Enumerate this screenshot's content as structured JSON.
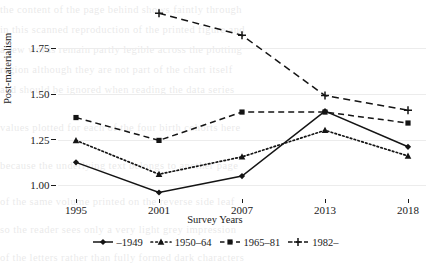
{
  "chart_data": {
    "type": "line",
    "title": "",
    "xlabel": "Survey Years",
    "ylabel": "Post-materialism",
    "x": [
      "1995",
      "2001",
      "2007",
      "2013",
      "2018"
    ],
    "categories": [
      "1995",
      "2001",
      "2007",
      "2013",
      "2018"
    ],
    "xtick_labels": [
      "1995",
      "2001",
      "2007",
      "2013",
      "2018"
    ],
    "ytick_labels": [
      "1.00",
      "1.25",
      "1.50",
      "1.75"
    ],
    "ytick_values": [
      1.0,
      1.25,
      1.5,
      1.75
    ],
    "ylim": [
      0.93,
      1.98
    ],
    "xlim_categories": true,
    "grid": "horizontal-faint",
    "legend_position": "bottom-center",
    "series": [
      {
        "name": "–1949",
        "label": "–1949",
        "marker": "diamond",
        "linestyle": "solid",
        "color": "#141414",
        "x": [
          "1995",
          "2001",
          "2007",
          "2013",
          "2018"
        ],
        "values": [
          1.125,
          0.96,
          1.05,
          1.405,
          1.21
        ]
      },
      {
        "name": "1950–64",
        "label": "1950–64",
        "marker": "triangle",
        "linestyle": "dotted",
        "color": "#141414",
        "x": [
          "1995",
          "2001",
          "2007",
          "2013",
          "2018"
        ],
        "values": [
          1.245,
          1.06,
          1.155,
          1.3,
          1.16
        ]
      },
      {
        "name": "1965–81",
        "label": "1965–81",
        "marker": "square",
        "linestyle": "dashed",
        "color": "#141414",
        "x": [
          "1995",
          "2001",
          "2007",
          "2013",
          "2018"
        ],
        "values": [
          1.37,
          1.245,
          1.4,
          1.4,
          1.34
        ]
      },
      {
        "name": "1982–",
        "label": "1982–",
        "marker": "plus",
        "linestyle": "dashed-long",
        "color": "#141414",
        "x": [
          "2001",
          "2007",
          "2013",
          "2018"
        ],
        "values": [
          1.94,
          1.82,
          1.49,
          1.41
        ]
      }
    ],
    "annotations": []
  },
  "axes": {
    "y_title": "Post-materialism",
    "x_title": "Survey Years"
  },
  "legend": {
    "items": [
      {
        "label": "–1949",
        "key": "solid-diamond-key"
      },
      {
        "label": "1950–64",
        "key": "dotted-triangle-key"
      },
      {
        "label": "1965–81",
        "key": "dashed-square-key"
      },
      {
        "label": "1982–",
        "key": "dashed-plus-key"
      }
    ]
  },
  "background_bleed": {
    "lines": [
      "the  content  of  the  page  behind  shows  faintly  through",
      "in  this  scanned  reproduction  of  the  printed  figure  and",
      "a  few  words  remain  partly  legible  across  the  plotting",
      "region  although  they  are  not  part  of  the  chart  itself",
      "and  should  be  ignored  when  reading  the  data  series",
      "values  plotted  for  each  of  the  four  birth  cohorts  here",
      "because  the  underlying  text  belongs  to  another  page",
      "of  the  same  volume  printed  on  the  reverse  side  leaf",
      "so  the  reader  sees  only  a  very  light  grey  impression",
      "of  the  letters  rather  than  fully  formed  dark  characters"
    ]
  }
}
